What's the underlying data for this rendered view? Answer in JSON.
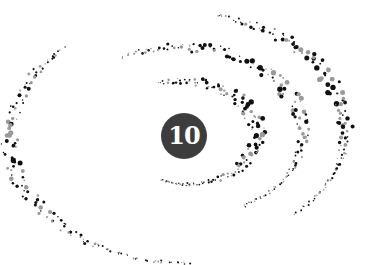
{
  "badge": {
    "number": "10",
    "background": "#3d3d3d",
    "text_color": "#ffffff"
  },
  "spiral": {
    "center": [
      184,
      136
    ],
    "dot_colors": {
      "dark": "#111111",
      "gray": "#9a9a9a"
    },
    "arms": [
      {
        "name": "outer-left-arm",
        "start_angle": 3.95,
        "end_angle": 1.55,
        "r_start": 150,
        "r_end": 155,
        "cx_offset": 0,
        "cy_offset": 0
      },
      {
        "name": "middle-arm",
        "start_angle": 4.2,
        "end_angle": 7.3,
        "r_start": 110,
        "r_end": 100
      },
      {
        "name": "inner-arm",
        "start_angle": 4.4,
        "end_angle": 8.2,
        "r_start": 68,
        "r_end": 58
      },
      {
        "name": "outer-right-arm",
        "start_angle": 4.9,
        "end_angle": 7.05,
        "r_start": 150,
        "r_end": 135
      }
    ]
  }
}
